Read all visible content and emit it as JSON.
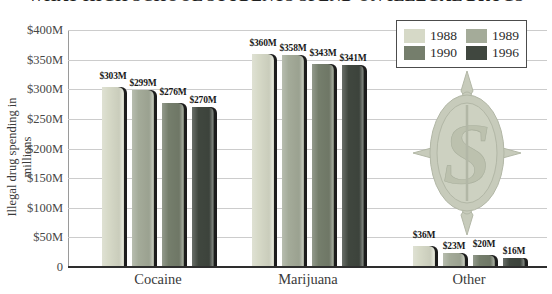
{
  "title": "WHAT HIGH SCHOOL STUDENTS SPEND ON ILLEGAL DRUGS",
  "y_axis_title": "Illegal drug spending in millions",
  "legend": {
    "position": "top-right",
    "items": [
      {
        "label": "1988",
        "color": "#d6d9c7"
      },
      {
        "label": "1989",
        "color": "#a4ab99"
      },
      {
        "label": "1990",
        "color": "#757e6c"
      },
      {
        "label": "1996",
        "color": "#40473f"
      }
    ]
  },
  "watermark": {
    "name": "dollar-sign-seal",
    "color": "#c7cbbb"
  },
  "chart_data": {
    "type": "bar",
    "title": "WHAT HIGH SCHOOL STUDENTS SPEND ON ILLEGAL DRUGS",
    "categories": [
      "Cocaine",
      "Marijuana",
      "Other"
    ],
    "series": [
      {
        "name": "1988",
        "color": "#d6d9c7",
        "values": [
          303,
          360,
          36
        ]
      },
      {
        "name": "1989",
        "color": "#a4ab99",
        "values": [
          299,
          358,
          23
        ]
      },
      {
        "name": "1990",
        "color": "#757e6c",
        "values": [
          276,
          343,
          20
        ]
      },
      {
        "name": "1996",
        "color": "#40473f",
        "values": [
          270,
          341,
          16
        ]
      }
    ],
    "value_labels": [
      [
        "$303M",
        "$360M",
        "$36M"
      ],
      [
        "$299M",
        "$358M",
        "$23M"
      ],
      [
        "$276M",
        "$343M",
        "$20M"
      ],
      [
        "$270M",
        "$341M",
        "$16M"
      ]
    ],
    "xlabel": "",
    "ylabel": "Illegal drug spending in millions",
    "ylim": [
      0,
      400
    ],
    "yticks": [
      400,
      350,
      300,
      250,
      200,
      150,
      100,
      50,
      0
    ],
    "ytick_labels": [
      "$400M",
      "$350M",
      "$300M",
      "$250M",
      "$200M",
      "$150M",
      "$100M",
      "$50M",
      "0"
    ],
    "grid": true,
    "legend_position": "top-right"
  }
}
